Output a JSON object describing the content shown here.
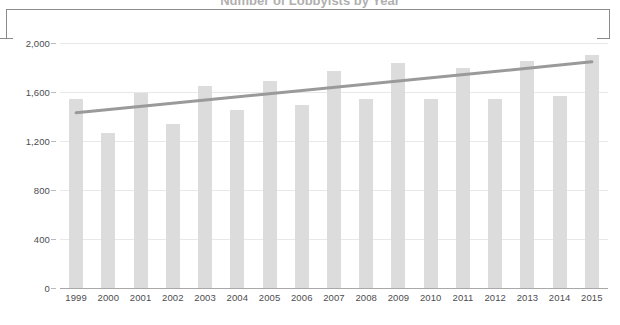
{
  "title_partial": "Number of Lobbyists by Year",
  "axis": {
    "y_label": "Number of Lobbyists",
    "y_ticks": [
      "0",
      "400",
      "800",
      "1,200",
      "1,600",
      "2,000"
    ]
  },
  "colors": {
    "bar": "#dcdcdc",
    "trendline": "#9a9a9a",
    "gridline": "#e8e8e8",
    "axis": "#a9a9a9",
    "text": "#4d4d4f",
    "bracket": "#8a8a8a"
  },
  "chart_data": {
    "type": "bar",
    "title": "Number of Lobbyists by Year",
    "xlabel": "",
    "ylabel": "Number of Lobbyists",
    "ylim": [
      0,
      2000
    ],
    "ytick_values": [
      0,
      400,
      800,
      1200,
      1600,
      2000
    ],
    "grid": true,
    "legend": false,
    "categories": [
      "1999",
      "2000",
      "2001",
      "2002",
      "2003",
      "2004",
      "2005",
      "2006",
      "2007",
      "2008",
      "2009",
      "2010",
      "2011",
      "2012",
      "2013",
      "2014",
      "2015"
    ],
    "values": [
      1539,
      1265,
      1592,
      1339,
      1649,
      1453,
      1690,
      1494,
      1771,
      1543,
      1837,
      1543,
      1796,
      1541,
      1853,
      1568,
      1902
    ],
    "series": [
      {
        "name": "Number of Lobbyists",
        "type": "bar",
        "values": [
          1539,
          1265,
          1592,
          1339,
          1649,
          1453,
          1690,
          1494,
          1771,
          1543,
          1837,
          1543,
          1796,
          1541,
          1853,
          1568,
          1902
        ]
      },
      {
        "name": "Trend",
        "type": "line",
        "values": [
          1430,
          1456,
          1482,
          1508,
          1534,
          1560,
          1586,
          1612,
          1638,
          1664,
          1690,
          1716,
          1742,
          1768,
          1794,
          1820,
          1846
        ]
      }
    ]
  }
}
